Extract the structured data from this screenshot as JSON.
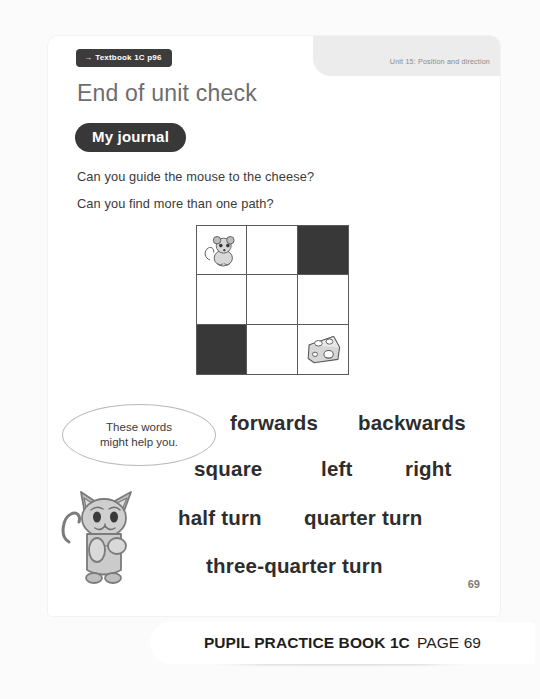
{
  "header": {
    "textbook_ref": "Textbook 1C p96",
    "textbook_ref_arrow": "→",
    "unit_label": "Unit 15: Position and direction"
  },
  "title": "End of unit check",
  "journal_badge": "My journal",
  "questions": [
    "Can you guide the mouse to the cheese?",
    "Can you find more than one path?"
  ],
  "grid": {
    "rows": 3,
    "columns": 3,
    "cells": [
      {
        "row": 1,
        "col": 1,
        "state": "mouse",
        "icon": "mouse-icon"
      },
      {
        "row": 1,
        "col": 2,
        "state": "open",
        "icon": ""
      },
      {
        "row": 1,
        "col": 3,
        "state": "blocked",
        "icon": ""
      },
      {
        "row": 2,
        "col": 1,
        "state": "open",
        "icon": ""
      },
      {
        "row": 2,
        "col": 2,
        "state": "open",
        "icon": ""
      },
      {
        "row": 2,
        "col": 3,
        "state": "open",
        "icon": ""
      },
      {
        "row": 3,
        "col": 1,
        "state": "blocked",
        "icon": ""
      },
      {
        "row": 3,
        "col": 2,
        "state": "open",
        "icon": ""
      },
      {
        "row": 3,
        "col": 3,
        "state": "cheese",
        "icon": "cheese-icon"
      }
    ]
  },
  "speech_bubble": {
    "line_1": "These words",
    "line_2": "might help you."
  },
  "mascot": "cat-mascot-icon",
  "word_bank": [
    "forwards",
    "backwards",
    "square",
    "left",
    "right",
    "half turn",
    "quarter turn",
    "three-quarter turn"
  ],
  "page_number": "69",
  "footer": {
    "book": "PUPIL PRACTICE BOOK 1C",
    "page": "PAGE 69"
  },
  "colors": {
    "badge_dark": "#383838",
    "title_grey": "#6d6d6d",
    "header_band": "#ececec",
    "blocked_cell": "#383838",
    "page_background": "#fbfbfb"
  }
}
